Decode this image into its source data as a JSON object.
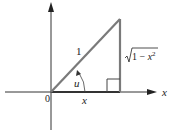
{
  "diagram": {
    "type": "right-triangle-unit-circle",
    "labels": {
      "hypotenuse": "1",
      "opposite": "√1 − x",
      "opposite_exponent": "2",
      "angle": "u",
      "adjacent": "x",
      "origin": "0",
      "x_axis": "x"
    },
    "colors": {
      "axes": "#333333",
      "hypotenuse": "#7a7a7a",
      "opposite_side": "#7a7a7a",
      "base": "#333333",
      "text": "#222222"
    }
  }
}
